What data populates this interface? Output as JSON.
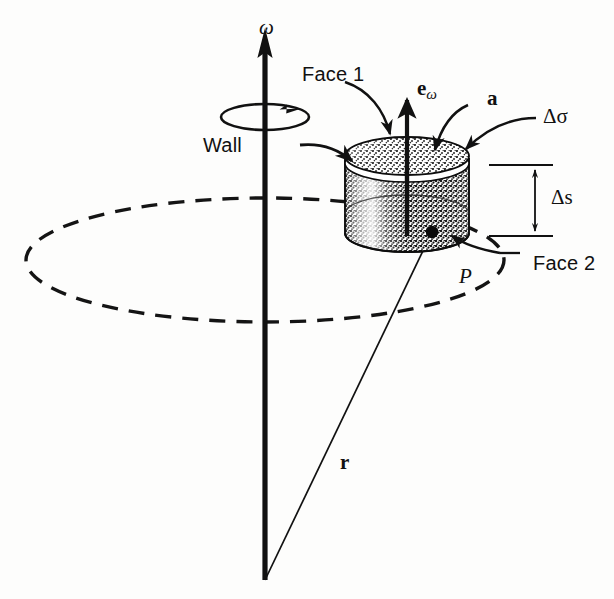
{
  "figure": {
    "background_color": "#fdfdfc",
    "ink_color": "#111111"
  },
  "labels": {
    "omega_axis": "ω",
    "face1": "Face 1",
    "face2": "Face 2",
    "wall": "Wall",
    "e_omega_base": "e",
    "e_omega_sub": "ω",
    "accel_vector": "a",
    "delta_sigma": "Δσ",
    "delta_s": "Δs",
    "point_p": "P",
    "radius_vector": "r"
  },
  "geometry": {
    "axis_top_y": 28,
    "axis_bottom_y": 580,
    "axis_x": 265,
    "cylinder_center_x": 407,
    "cylinder_top_y": 158,
    "cylinder_bottom_y": 233,
    "cylinder_rx": 62,
    "cylinder_ry": 19,
    "point_p_x": 432,
    "point_p_y": 232,
    "ground_ellipse_cx": 265,
    "ground_ellipse_cy": 260,
    "ground_ellipse_rx": 239,
    "ground_ellipse_ry": 62,
    "spin_ellipse_cx": 265,
    "spin_ellipse_cy": 117,
    "spin_ellipse_rx": 44,
    "spin_ellipse_ry": 13,
    "dim_line_x_left": 489,
    "dim_line_x_right": 552,
    "dim_arrow_x": 535,
    "dim_top_y": 165,
    "dim_bottom_y": 236
  },
  "icon_names": {
    "axis": "rotation-axis-arrow-icon",
    "spin": "spin-direction-icon",
    "cylinder": "control-volume-cylinder-icon",
    "ground": "dashed-circle-path-icon",
    "radius": "radius-vector-line-icon",
    "point": "point-marker-icon"
  }
}
